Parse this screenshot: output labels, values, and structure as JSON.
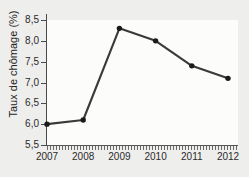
{
  "chart_data": {
    "type": "line",
    "title": "",
    "xlabel": "",
    "ylabel": "Taux de chômage (%)",
    "categories": [
      "2007",
      "2008",
      "2009",
      "2010",
      "2011",
      "2012"
    ],
    "x": [
      2007,
      2008,
      2009,
      2010,
      2011,
      2012
    ],
    "values": [
      6.0,
      6.1,
      8.3,
      8.0,
      7.4,
      7.1
    ],
    "series": [
      {
        "name": "Taux de chômage",
        "values": [
          6.0,
          6.1,
          8.3,
          8.0,
          7.4,
          7.1
        ]
      }
    ],
    "ylim": [
      5.5,
      8.5
    ],
    "yticks": [
      5.5,
      6.0,
      6.5,
      7.0,
      7.5,
      8.0,
      8.5
    ],
    "ytick_labels": [
      "5,5",
      "6,0",
      "6,5",
      "7,0",
      "7,5",
      "8,0",
      "8,5"
    ],
    "xtick_labels": [
      "2007",
      "2008",
      "2009",
      "2010",
      "2011",
      "2012"
    ],
    "grid": false,
    "legend": "none",
    "marker": "circle",
    "line_color": "#3a3a3a",
    "marker_color": "#1a1a1a",
    "background_color": "#eeeeec",
    "plot_background_color": "#fcfcfb",
    "axis_color": "#4a4a4a",
    "text_color": "#2b2b2b"
  }
}
